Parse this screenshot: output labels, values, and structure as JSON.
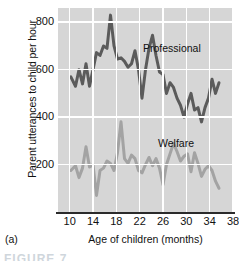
{
  "figure": {
    "panel_letter": "(a)",
    "caption_remnant": "FIGURE 7"
  },
  "chart_data": {
    "type": "line",
    "title": "",
    "xlabel": "Age of children (months)",
    "ylabel": "Parent utterances to child per hour",
    "xlim": [
      8,
      38
    ],
    "ylim": [
      0,
      860
    ],
    "xticks": [
      10,
      14,
      18,
      22,
      26,
      30,
      34,
      38
    ],
    "yticks": [
      200,
      400,
      600,
      800
    ],
    "grid": true,
    "grid_color": "#ffffff",
    "plot_background": "#d6d6d6",
    "legend_position": "inline-annotation",
    "series": [
      {
        "name": "Professional",
        "color": "#5b5b5b",
        "label_x": 27.5,
        "label_y": 690,
        "x": [
          10.2,
          11.0,
          11.6,
          12.2,
          12.8,
          13.4,
          14.0,
          14.6,
          15.2,
          15.8,
          16.4,
          17.0,
          17.6,
          18.2,
          18.8,
          19.4,
          20.0,
          20.6,
          21.2,
          21.8,
          22.4,
          23.0,
          23.6,
          24.2,
          24.8,
          25.4,
          26.0,
          26.6,
          27.2,
          27.8,
          28.4,
          29.0,
          29.6,
          30.2,
          30.8,
          31.4,
          32.0,
          32.6,
          33.2,
          33.8,
          34.4,
          35.0,
          35.6
        ],
        "y": [
          570,
          530,
          600,
          540,
          625,
          530,
          600,
          672,
          660,
          700,
          690,
          830,
          700,
          645,
          650,
          635,
          610,
          625,
          680,
          600,
          480,
          600,
          690,
          745,
          660,
          590,
          580,
          500,
          545,
          525,
          480,
          450,
          400,
          455,
          500,
          430,
          440,
          380,
          440,
          480,
          560,
          500,
          545
        ],
        "line_width": 3
      },
      {
        "name": "Welfare",
        "color": "#a3a3a3",
        "label_x": 28.0,
        "label_y": 330,
        "x": [
          10.2,
          11.0,
          11.6,
          12.2,
          12.8,
          13.4,
          14.0,
          14.6,
          15.2,
          15.8,
          16.4,
          17.0,
          17.6,
          18.2,
          18.8,
          19.4,
          20.0,
          20.6,
          21.2,
          21.8,
          22.4,
          23.0,
          23.6,
          24.2,
          24.8,
          25.4,
          26.0,
          26.6,
          27.2,
          27.8,
          28.4,
          29.0,
          29.6,
          30.2,
          30.8,
          31.4,
          32.0,
          32.6,
          33.2,
          33.8,
          34.4,
          35.0,
          35.6
        ],
        "y": [
          175,
          195,
          145,
          185,
          275,
          190,
          200,
          70,
          175,
          185,
          215,
          205,
          175,
          250,
          380,
          225,
          205,
          240,
          225,
          175,
          165,
          200,
          230,
          195,
          225,
          185,
          115,
          200,
          245,
          290,
          255,
          215,
          235,
          245,
          170,
          250,
          205,
          150,
          180,
          195,
          175,
          130,
          100
        ],
        "line_width": 3
      }
    ]
  }
}
